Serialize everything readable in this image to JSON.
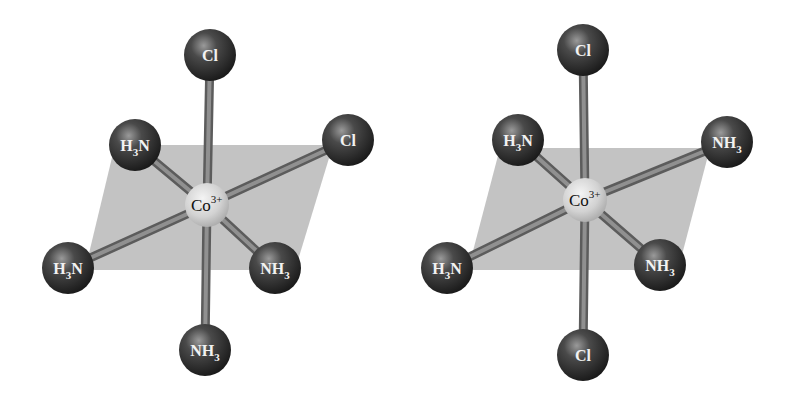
{
  "diagram": {
    "colors": {
      "background": "#ffffff",
      "plane": "#b9b9b9",
      "bond": "#8a8a8a",
      "ligand_sphere": "#3a3a3a",
      "center_sphere": "#d9d9d9",
      "ligand_label": "#f2f2f2",
      "center_label": "#111111"
    },
    "molecules": [
      {
        "name": "left-isomer",
        "center": {
          "label": "Co",
          "charge": "3+",
          "x": 207,
          "y": 205
        },
        "plane": [
          [
            115,
            145
          ],
          [
            333,
            145
          ],
          [
            295,
            270
          ],
          [
            85,
            270
          ]
        ],
        "ligands": [
          {
            "position": "top",
            "label": "Cl",
            "sub": "",
            "x": 210,
            "y": 55
          },
          {
            "position": "upper-left",
            "label": "H",
            "sub": "3",
            "tail": "N",
            "x": 135,
            "y": 145
          },
          {
            "position": "upper-right",
            "label": "Cl",
            "sub": "",
            "x": 348,
            "y": 140
          },
          {
            "position": "lower-left",
            "label": "H",
            "sub": "3",
            "tail": "N",
            "x": 68,
            "y": 268
          },
          {
            "position": "lower-right",
            "label": "NH",
            "sub": "3",
            "tail": "",
            "x": 275,
            "y": 268
          },
          {
            "position": "bottom",
            "label": "NH",
            "sub": "3",
            "tail": "",
            "x": 205,
            "y": 350
          }
        ]
      },
      {
        "name": "right-isomer",
        "center": {
          "label": "Co",
          "charge": "3+",
          "x": 585,
          "y": 200
        },
        "plane": [
          [
            500,
            148
          ],
          [
            710,
            148
          ],
          [
            678,
            270
          ],
          [
            468,
            270
          ]
        ],
        "ligands": [
          {
            "position": "top",
            "label": "Cl",
            "sub": "",
            "x": 583,
            "y": 50
          },
          {
            "position": "upper-left",
            "label": "H",
            "sub": "3",
            "tail": "N",
            "x": 518,
            "y": 140
          },
          {
            "position": "upper-right",
            "label": "NH",
            "sub": "3",
            "tail": "",
            "x": 727,
            "y": 142
          },
          {
            "position": "lower-left",
            "label": "H",
            "sub": "3",
            "tail": "N",
            "x": 447,
            "y": 268
          },
          {
            "position": "lower-right",
            "label": "NH",
            "sub": "3",
            "tail": "",
            "x": 660,
            "y": 265
          },
          {
            "position": "bottom",
            "label": "Cl",
            "sub": "",
            "x": 583,
            "y": 355
          }
        ]
      }
    ]
  }
}
